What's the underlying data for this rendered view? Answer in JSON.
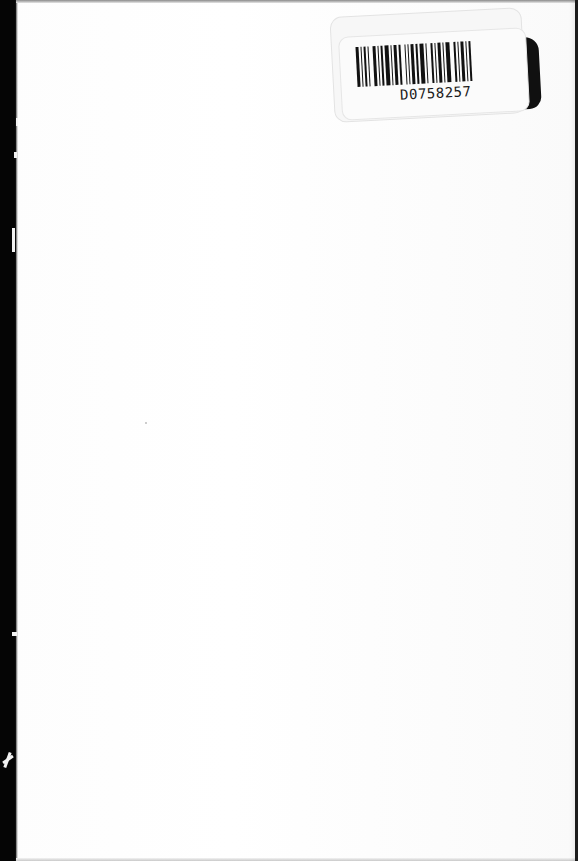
{
  "document": {
    "type": "scanned-book-page",
    "content": "blank",
    "colors": {
      "paper": "#ffffff",
      "edge": "#050505"
    }
  },
  "barcode_label": {
    "code": "D0758257"
  }
}
